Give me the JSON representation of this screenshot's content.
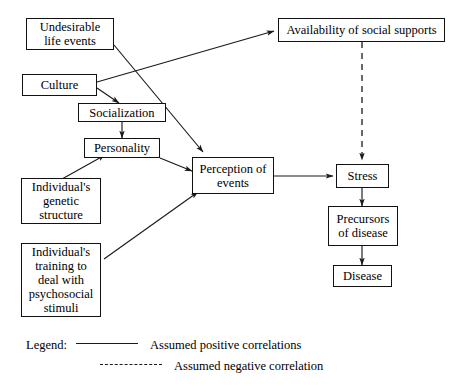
{
  "diagram": {
    "nodes": [
      {
        "id": "undesirable",
        "label": "Undesirable\nlife events"
      },
      {
        "id": "culture",
        "label": "Culture"
      },
      {
        "id": "socialization",
        "label": "Socialization"
      },
      {
        "id": "personality",
        "label": "Personality"
      },
      {
        "id": "genetic",
        "label": "Individual's\ngenetic\nstructure"
      },
      {
        "id": "training",
        "label": "Individual's\ntraining to\ndeal with\npsychosocial\nstimuli"
      },
      {
        "id": "perception",
        "label": "Perception of\nevents"
      },
      {
        "id": "availability",
        "label": "Availability of social supports"
      },
      {
        "id": "stress",
        "label": "Stress"
      },
      {
        "id": "precursors",
        "label": "Precursors\nof disease"
      },
      {
        "id": "disease",
        "label": "Disease"
      }
    ],
    "edges": [
      {
        "from": "undesirable",
        "to": "perception",
        "type": "positive"
      },
      {
        "from": "culture",
        "to": "availability",
        "type": "positive"
      },
      {
        "from": "culture",
        "to": "socialization",
        "type": "positive"
      },
      {
        "from": "socialization",
        "to": "personality",
        "type": "positive"
      },
      {
        "from": "personality",
        "to": "perception",
        "type": "positive"
      },
      {
        "from": "genetic",
        "to": "personality",
        "type": "positive"
      },
      {
        "from": "training",
        "to": "perception",
        "type": "positive"
      },
      {
        "from": "perception",
        "to": "stress",
        "type": "positive"
      },
      {
        "from": "availability",
        "to": "stress",
        "type": "negative"
      },
      {
        "from": "stress",
        "to": "precursors",
        "type": "positive"
      },
      {
        "from": "precursors",
        "to": "disease",
        "type": "positive"
      }
    ]
  },
  "legend": {
    "title": "Legend:",
    "positive_label": "Assumed positive correlations",
    "negative_label": "Assumed negative correlation"
  },
  "colors": {
    "ink": "#1a1a1a",
    "box_border": "#111111",
    "background": "#ffffff"
  }
}
